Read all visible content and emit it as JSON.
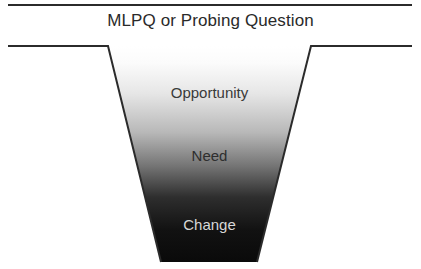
{
  "header": {
    "title": "MLPQ or Probing Question"
  },
  "funnel": {
    "stages": [
      {
        "label": "Opportunity"
      },
      {
        "label": "Need"
      },
      {
        "label": "Change"
      }
    ],
    "colors": {
      "gradient_top": "#ffffff",
      "gradient_mid": "#8a8a8a",
      "gradient_bottom": "#0d0d0d",
      "outline": "#2b2b2b"
    }
  }
}
